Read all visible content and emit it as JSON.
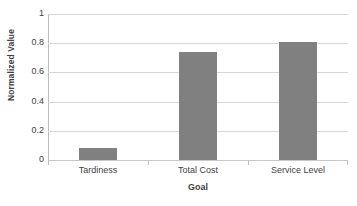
{
  "chart_data": {
    "type": "bar",
    "title": "",
    "categories": [
      "Tardiness",
      "Total Cost",
      "Service Level"
    ],
    "values": [
      0.08,
      0.74,
      0.81
    ],
    "xlabel": "Goal",
    "ylabel": "Normalized Value",
    "ylim": [
      0,
      1
    ],
    "ytick_labels": [
      "1",
      "0.8",
      "0.6",
      "0.4",
      "0.2",
      "0"
    ],
    "ytick_values": [
      1,
      0.8,
      0.6,
      0.4,
      0.2,
      0
    ],
    "grid": true,
    "legend": false,
    "series": [
      {
        "name": "Normalized Value",
        "values": [
          0.08,
          0.74,
          0.81
        ]
      }
    ],
    "colors": {
      "bar": "#808080",
      "gridline": "#d6d6d6",
      "axis": "#bdbdbd",
      "text": "#3f3f3f",
      "background": "#ffffff"
    }
  }
}
